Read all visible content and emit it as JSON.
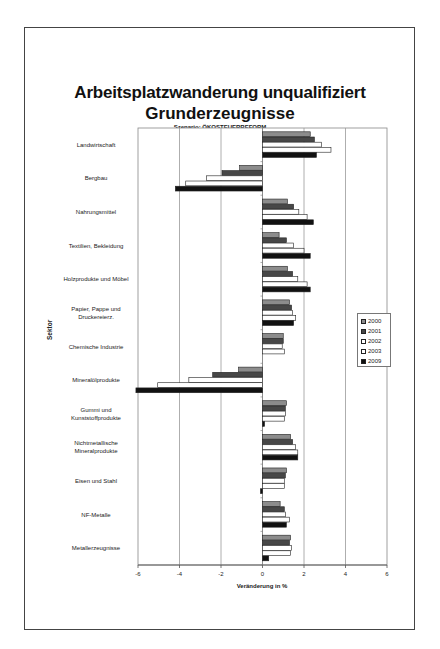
{
  "page": {
    "title_line1": "Arbeitsplatzwanderung unqualifiziert",
    "title_line2": "Grunderzeugnisse",
    "subtitle": "Szenario: ÖKOSTEUERREFORM"
  },
  "chart_data": {
    "type": "bar",
    "orientation": "horizontal",
    "subtitle": "Szenario: ÖKOSTEUERREFORM",
    "xlabel": "Veränderung in %",
    "ylabel": "Sektor",
    "xlim": [
      -6,
      6
    ],
    "xticks": [
      -6,
      -4,
      -2,
      0,
      2,
      4,
      6
    ],
    "grid": true,
    "legend_position": "right",
    "categories": [
      [
        "Landwirtschaft"
      ],
      [
        "Bergbau"
      ],
      [
        "Nahrungsmittel"
      ],
      [
        "Textilien, Bekleidung"
      ],
      [
        "Holzprodukte und Möbel"
      ],
      [
        "Papier, Pappe und",
        "Druckereierz."
      ],
      [
        "Chemische Industrie"
      ],
      [
        "Mineralölprodukte"
      ],
      [
        "Gummi und",
        "Kunststoffprodukte"
      ],
      [
        "Nichtmetallische",
        "Mineralprodukte"
      ],
      [
        "Eisen und Stahl"
      ],
      [
        "NF-Metalle"
      ],
      [
        "Metallerzeugnisse"
      ]
    ],
    "series": [
      {
        "name": "2000",
        "color": "#8c8c8c",
        "values": [
          2.3,
          -1.1,
          1.2,
          0.8,
          1.2,
          1.3,
          1.0,
          -1.15,
          1.15,
          1.35,
          1.15,
          0.85,
          1.35
        ]
      },
      {
        "name": "2001",
        "color": "#474747",
        "values": [
          2.5,
          -1.95,
          1.5,
          1.15,
          1.45,
          1.4,
          1.0,
          -2.4,
          1.1,
          1.45,
          1.1,
          1.05,
          1.3
        ]
      },
      {
        "name": "2002",
        "color": "#ffffff",
        "values": [
          2.85,
          -2.7,
          1.75,
          1.5,
          1.7,
          1.45,
          0.95,
          -3.55,
          1.1,
          1.6,
          1.05,
          1.1,
          1.4
        ]
      },
      {
        "name": "2003",
        "color": "#ffffff",
        "values": [
          3.3,
          -3.7,
          2.15,
          2.0,
          2.15,
          1.6,
          1.05,
          -5.05,
          1.05,
          1.7,
          1.05,
          1.3,
          1.35
        ]
      },
      {
        "name": "2009",
        "color": "#111111",
        "values": [
          2.6,
          -4.2,
          2.45,
          2.3,
          2.3,
          1.5,
          0.0,
          -6.1,
          0.1,
          1.7,
          -0.1,
          1.15,
          0.3
        ]
      }
    ]
  }
}
